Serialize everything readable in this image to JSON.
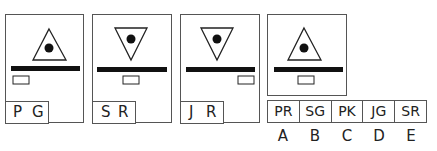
{
  "panels": [
    {
      "label": [
        "P",
        "G"
      ],
      "triangle": "up",
      "small_rect": "left"
    },
    {
      "label": [
        "S",
        "R"
      ],
      "triangle": "down",
      "small_rect": "center"
    },
    {
      "label": [
        "J",
        "R"
      ],
      "triangle": "down",
      "small_rect": "right"
    },
    {
      "label": null,
      "triangle": "up",
      "small_rect": "center"
    }
  ],
  "options": [
    {
      "letter": "A",
      "code": "PR"
    },
    {
      "letter": "B",
      "code": "SG"
    },
    {
      "letter": "C",
      "code": "PK"
    },
    {
      "letter": "D",
      "code": "JG"
    },
    {
      "letter": "E",
      "code": "SR"
    }
  ]
}
